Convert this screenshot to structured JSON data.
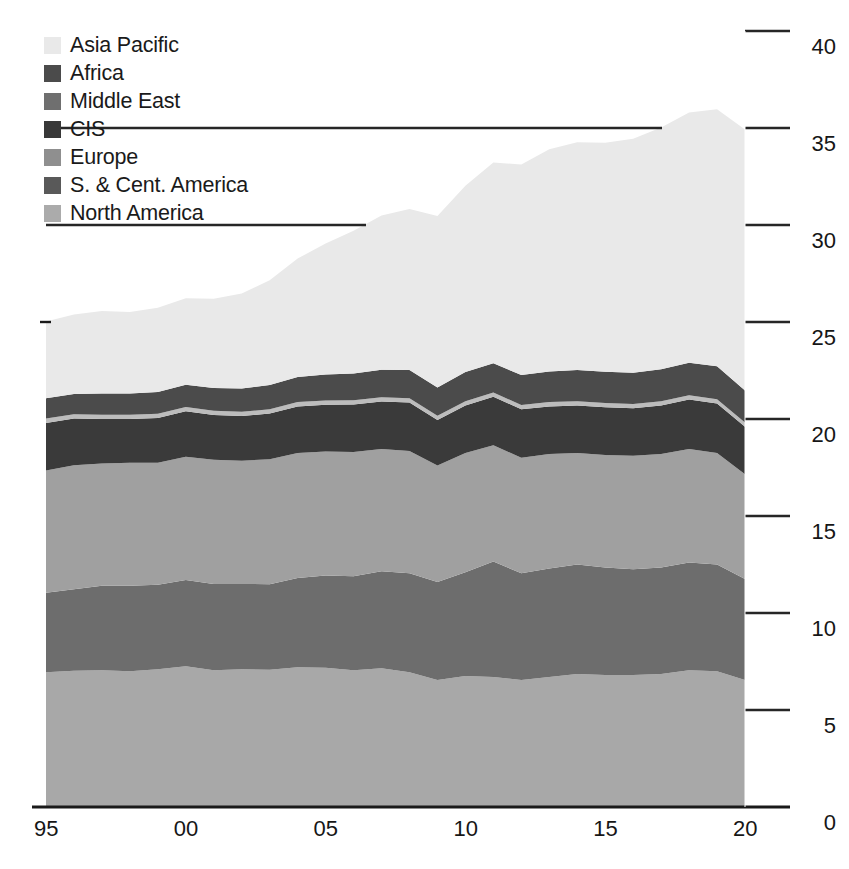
{
  "chart_data": {
    "type": "area",
    "stacked": true,
    "title": "",
    "subtitle": "",
    "xlabel": "",
    "ylabel": "",
    "xlim": [
      1995,
      2020
    ],
    "ylim": [
      0,
      40
    ],
    "grid": true,
    "grid_orientation": "horizontal",
    "legend_position": "top-left",
    "y_ticks": [
      0,
      5,
      10,
      15,
      20,
      25,
      30,
      35,
      40
    ],
    "y_tick_labels": [
      "0",
      "5",
      "10",
      "15",
      "20",
      "25",
      "30",
      "35",
      "40"
    ],
    "y_axis_side": "right",
    "x_ticks": [
      1995,
      2000,
      2005,
      2010,
      2015,
      2020
    ],
    "x_tick_labels": [
      "95",
      "00",
      "05",
      "10",
      "15",
      "20"
    ],
    "x": [
      1995,
      1996,
      1997,
      1998,
      1999,
      2000,
      2001,
      2002,
      2003,
      2004,
      2005,
      2006,
      2007,
      2008,
      2009,
      2010,
      2011,
      2012,
      2013,
      2014,
      2015,
      2016,
      2017,
      2018,
      2019,
      2020
    ],
    "series": [
      {
        "name": "North America",
        "color": "#a8a8a8",
        "values": [
          6.95,
          7.02,
          7.05,
          7.0,
          7.1,
          7.25,
          7.05,
          7.1,
          7.08,
          7.2,
          7.18,
          7.05,
          7.15,
          6.95,
          6.55,
          6.75,
          6.7,
          6.55,
          6.7,
          6.85,
          6.8,
          6.8,
          6.85,
          7.05,
          7.0,
          6.55
        ]
      },
      {
        "name": "S. & Cent. America",
        "color": "#6d6d6d",
        "values": [
          4.1,
          4.2,
          4.35,
          4.4,
          4.35,
          4.45,
          4.45,
          4.4,
          4.4,
          4.6,
          4.75,
          4.85,
          5.0,
          5.1,
          5.05,
          5.35,
          5.95,
          5.5,
          5.6,
          5.65,
          5.55,
          5.45,
          5.5,
          5.55,
          5.5,
          5.2
        ]
      },
      {
        "name": "Europe",
        "color": "#a0a0a0",
        "values": [
          6.3,
          6.4,
          6.3,
          6.35,
          6.3,
          6.35,
          6.4,
          6.35,
          6.45,
          6.45,
          6.4,
          6.4,
          6.3,
          6.3,
          6.0,
          6.15,
          6.0,
          5.95,
          5.9,
          5.75,
          5.8,
          5.85,
          5.85,
          5.85,
          5.75,
          5.4
        ]
      },
      {
        "name": "CIS",
        "color": "#3a3a3a",
        "values": [
          2.45,
          2.4,
          2.3,
          2.25,
          2.3,
          2.35,
          2.3,
          2.3,
          2.35,
          2.4,
          2.4,
          2.45,
          2.45,
          2.5,
          2.35,
          2.45,
          2.5,
          2.5,
          2.45,
          2.45,
          2.45,
          2.45,
          2.5,
          2.55,
          2.55,
          2.45
        ]
      },
      {
        "name": "Middle East",
        "color": "#bcbcbc",
        "values": [
          0.22,
          0.22,
          0.22,
          0.22,
          0.22,
          0.22,
          0.22,
          0.22,
          0.22,
          0.22,
          0.22,
          0.22,
          0.22,
          0.22,
          0.22,
          0.22,
          0.22,
          0.22,
          0.22,
          0.22,
          0.22,
          0.22,
          0.22,
          0.22,
          0.22,
          0.22
        ]
      },
      {
        "name": "Africa",
        "color": "#4b4b4b",
        "values": [
          1.05,
          1.05,
          1.1,
          1.1,
          1.12,
          1.15,
          1.18,
          1.2,
          1.25,
          1.3,
          1.35,
          1.38,
          1.42,
          1.45,
          1.45,
          1.5,
          1.5,
          1.55,
          1.58,
          1.6,
          1.62,
          1.62,
          1.65,
          1.68,
          1.7,
          1.65
        ]
      },
      {
        "name": "Asia Pacific",
        "color": "#e9e9e9",
        "values": [
          3.95,
          4.1,
          4.25,
          4.2,
          4.35,
          4.45,
          4.6,
          4.9,
          5.4,
          6.1,
          6.75,
          7.35,
          7.95,
          8.3,
          8.85,
          9.6,
          10.35,
          10.85,
          11.45,
          11.75,
          11.8,
          12.05,
          12.45,
          12.9,
          13.25,
          13.45
        ]
      }
    ]
  },
  "legend": {
    "items": [
      {
        "label": "Asia Pacific",
        "color": "#e9e9e9"
      },
      {
        "label": "Africa",
        "color": "#4b4b4b"
      },
      {
        "label": "Middle East",
        "color": "#6f6f6f"
      },
      {
        "label": "CIS",
        "color": "#383838"
      },
      {
        "label": "Europe",
        "color": "#8f8f8f"
      },
      {
        "label": "S. & Cent. America",
        "color": "#595959"
      },
      {
        "label": "North America",
        "color": "#ababab"
      }
    ]
  },
  "axes": {
    "y_labels": [
      "40",
      "35",
      "30",
      "25",
      "20",
      "15",
      "10",
      "5",
      "0"
    ],
    "x_labels": [
      "95",
      "00",
      "05",
      "10",
      "15",
      "20"
    ]
  },
  "colors": {
    "axis_line": "#1a1a1a",
    "grid_line": "#262626",
    "background": "#ffffff",
    "text": "#161616"
  }
}
